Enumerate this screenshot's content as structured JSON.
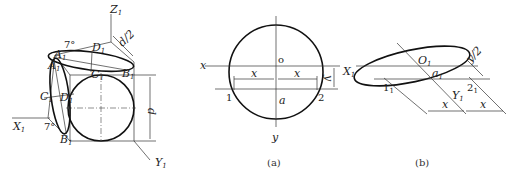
{
  "figure": {
    "left": {
      "labels": {
        "z_axis": "Z",
        "z_sub": "1",
        "x_axis": "X",
        "x_sub": "1",
        "y_axis": "Y",
        "y_sub": "1",
        "d_half": "d/2",
        "d": "d",
        "A": "A",
        "A_sub": "1",
        "A2": "A",
        "A2_sub": "1",
        "B_top": "B",
        "B_top_sub": "1",
        "B_bot": "B",
        "B_bot_sub": "1",
        "C_top": "C",
        "C_top_sub": "1",
        "C_left": "C",
        "C_left_sub": "1",
        "D_top": "D",
        "D_top_sub": "1",
        "D_left": "D",
        "D_left_sub": "1",
        "angle_top": "7°",
        "angle_bot": "7°"
      }
    },
    "panel_a": {
      "caption": "(a)",
      "labels": {
        "x_axis": "x",
        "y_axis": "y",
        "origin": "o",
        "point_a": "a",
        "point_1": "1",
        "point_2": "2",
        "dim_x_left": "x",
        "dim_x_right": "x",
        "dim_y": "y"
      }
    },
    "panel_b": {
      "caption": "(b)",
      "labels": {
        "x_axis": "X",
        "x_sub": "1",
        "y_axis": "Y",
        "y_sub": "1",
        "origin": "O",
        "origin_sub": "1",
        "point_a": "a",
        "point_a_sub": "1",
        "point_1": "1",
        "point_1_sub": "1",
        "point_2": "2",
        "point_2_sub": "1",
        "dim_x_left": "x",
        "dim_x_right": "x",
        "dim_y_half": "y/2"
      }
    }
  }
}
